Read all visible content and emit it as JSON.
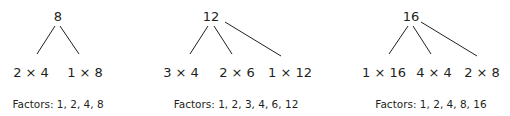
{
  "trees": [
    {
      "root": "8",
      "children": [
        "2 × 4",
        "1 × 8"
      ],
      "factors_label": "Factors: 1, 2, 4, 8"
    },
    {
      "root": "12",
      "children": [
        "3 × 4",
        "2 × 6",
        "1 × 12"
      ],
      "factors_label": "Factors: 1, 2, 3, 4, 6, 12"
    },
    {
      "root": "16",
      "children": [
        "1 × 16",
        "4 × 4",
        "2 × 8"
      ],
      "factors_label": "Factors: 1, 2, 4, 8, 16"
    }
  ],
  "colors": {
    "ink": "#231f20",
    "background": "#ffffff"
  }
}
